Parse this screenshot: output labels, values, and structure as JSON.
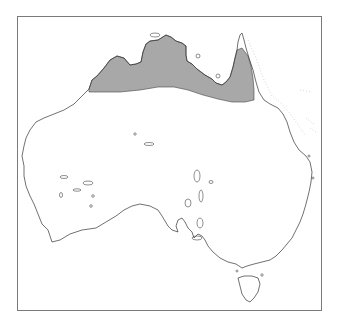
{
  "map": {
    "region": "Australia",
    "colors": {
      "frame": "#7a7a7a",
      "coastline": "#333333",
      "range_fill": "#a8a8a8",
      "background": "#ffffff"
    },
    "legend": [],
    "labels": [],
    "shaded_ranges": [
      {
        "name": "northern-tropical-range",
        "description": "Northern Australia band from Kimberley across Top End and Gulf of Carpentaria to Cape York Peninsula"
      }
    ]
  }
}
